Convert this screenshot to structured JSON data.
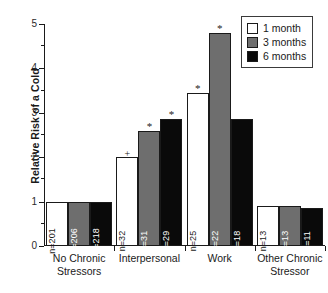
{
  "chart_data": {
    "type": "bar",
    "title": "",
    "xlabel": "",
    "ylabel": "Relative Risk of a Cold",
    "ylim": [
      0,
      5
    ],
    "yticks": [
      0,
      1,
      2,
      3,
      4,
      5
    ],
    "ytick_labels": [
      "0",
      "1",
      "2",
      "3",
      "4",
      "5"
    ],
    "yminor_ticks": [
      0.5,
      1.5,
      2.5,
      3.5,
      4.5
    ],
    "grid": false,
    "legend_position": "top-right",
    "categories": [
      "No Chronic Stressors",
      "Interpersonal",
      "Work",
      "Other Chronic Stressor"
    ],
    "category_lines": [
      [
        "No Chronic",
        "Stressors"
      ],
      [
        "Interpersonal"
      ],
      [
        "Work"
      ],
      [
        "Other Chronic",
        "Stressor"
      ]
    ],
    "series": [
      {
        "name": "1 month",
        "color": "#ffffff",
        "values": [
          1.0,
          2.0,
          3.45,
          0.9
        ],
        "n_labels": [
          "n=201",
          "n=32",
          "n=25",
          "n=13"
        ],
        "significance": [
          "",
          "+",
          "*",
          ""
        ]
      },
      {
        "name": "3 months",
        "color": "#6e6e6e",
        "values": [
          1.0,
          2.6,
          4.8,
          0.9
        ],
        "n_labels": [
          "n=206",
          "n=31",
          "n=22",
          "n=13"
        ],
        "significance": [
          "",
          "*",
          "*",
          ""
        ]
      },
      {
        "name": "6 months",
        "color": "#0a0a0a",
        "values": [
          1.0,
          2.85,
          2.85,
          0.85
        ],
        "n_labels": [
          "n=218",
          "n=29",
          "n=18",
          "n=11"
        ],
        "significance": [
          "",
          "*",
          "",
          ""
        ]
      }
    ]
  },
  "legend": {
    "items": [
      {
        "label": "1 month",
        "swatch": "legend-swatch-white"
      },
      {
        "label": "3 months",
        "swatch": "legend-swatch-gray"
      },
      {
        "label": "6 months",
        "swatch": "legend-swatch-black"
      }
    ]
  }
}
